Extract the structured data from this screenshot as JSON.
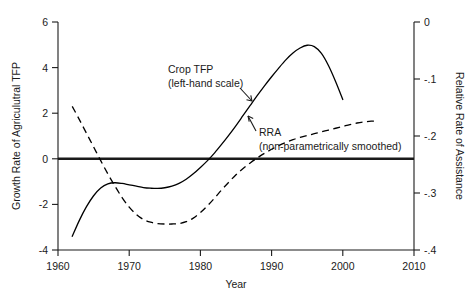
{
  "chart_data": {
    "type": "line",
    "title": "",
    "xlabel": "Year",
    "ylabel": "Growth Rate of Agriculutral TFP",
    "y2label": "Relative Rate of Assistance",
    "xlim": [
      1960,
      2010
    ],
    "ylim": [
      -4,
      6
    ],
    "y2lim": [
      -0.4,
      0.0
    ],
    "xticks": [
      "1960",
      "1970",
      "1980",
      "1990",
      "2000",
      "2010"
    ],
    "xtick_values": [
      1960,
      1970,
      1980,
      1990,
      2000,
      2010
    ],
    "yticks": [
      "6",
      "4",
      "2",
      "0",
      "-2",
      "-4"
    ],
    "ytick_values": [
      6,
      4,
      2,
      0,
      -2,
      -4
    ],
    "y2ticks": [
      "0",
      "-.1",
      "-.2",
      "-.3",
      "-.4"
    ],
    "y2tick_values": [
      0,
      -0.1,
      -0.2,
      -0.3,
      -0.4
    ],
    "grid": false,
    "zero_line": 0,
    "legend_position": "inline-annotations",
    "series": [
      {
        "name": "Crop TFP",
        "axis": "left",
        "style": "solid",
        "color": "#000000",
        "points": [
          [
            1962.0,
            -3.4
          ],
          [
            1963.0,
            -2.7
          ],
          [
            1964.0,
            -2.1
          ],
          [
            1965.0,
            -1.62
          ],
          [
            1966.0,
            -1.28
          ],
          [
            1967.0,
            -1.1
          ],
          [
            1968.0,
            -1.05
          ],
          [
            1969.0,
            -1.08
          ],
          [
            1970.0,
            -1.14
          ],
          [
            1971.0,
            -1.2
          ],
          [
            1972.0,
            -1.26
          ],
          [
            1973.0,
            -1.29
          ],
          [
            1974.0,
            -1.3
          ],
          [
            1975.0,
            -1.27
          ],
          [
            1976.0,
            -1.2
          ],
          [
            1977.0,
            -1.08
          ],
          [
            1978.0,
            -0.9
          ],
          [
            1979.0,
            -0.66
          ],
          [
            1980.0,
            -0.38
          ],
          [
            1981.0,
            -0.08
          ],
          [
            1982.0,
            0.26
          ],
          [
            1983.0,
            0.64
          ],
          [
            1984.0,
            1.04
          ],
          [
            1985.0,
            1.46
          ],
          [
            1986.0,
            1.9
          ],
          [
            1987.0,
            2.34
          ],
          [
            1988.0,
            2.78
          ],
          [
            1989.0,
            3.2
          ],
          [
            1990.0,
            3.6
          ],
          [
            1991.0,
            3.98
          ],
          [
            1992.0,
            4.34
          ],
          [
            1993.0,
            4.64
          ],
          [
            1994.0,
            4.86
          ],
          [
            1995.0,
            4.98
          ],
          [
            1996.0,
            4.92
          ],
          [
            1997.0,
            4.62
          ],
          [
            1998.0,
            4.08
          ],
          [
            1999.0,
            3.38
          ],
          [
            2000.0,
            2.6
          ]
        ]
      },
      {
        "name": "RRA (non-parametrically smoothed)",
        "axis": "right",
        "style": "dashed",
        "color": "#000000",
        "points_left_scale": [
          [
            1962.0,
            2.3
          ],
          [
            1963.0,
            1.72
          ],
          [
            1964.0,
            1.12
          ],
          [
            1965.0,
            0.52
          ],
          [
            1966.0,
            -0.08
          ],
          [
            1967.0,
            -0.66
          ],
          [
            1968.0,
            -1.2
          ],
          [
            1969.0,
            -1.7
          ],
          [
            1970.0,
            -2.12
          ],
          [
            1971.0,
            -2.44
          ],
          [
            1972.0,
            -2.66
          ],
          [
            1973.0,
            -2.78
          ],
          [
            1974.0,
            -2.84
          ],
          [
            1975.0,
            -2.86
          ],
          [
            1976.0,
            -2.86
          ],
          [
            1977.0,
            -2.84
          ],
          [
            1978.0,
            -2.76
          ],
          [
            1979.0,
            -2.6
          ],
          [
            1980.0,
            -2.36
          ],
          [
            1981.0,
            -2.06
          ],
          [
            1982.0,
            -1.72
          ],
          [
            1983.0,
            -1.36
          ],
          [
            1984.0,
            -1.02
          ],
          [
            1985.0,
            -0.7
          ],
          [
            1986.0,
            -0.42
          ],
          [
            1987.0,
            -0.18
          ],
          [
            1988.0,
            0.04
          ],
          [
            1989.0,
            0.24
          ],
          [
            1990.0,
            0.42
          ],
          [
            1991.0,
            0.58
          ],
          [
            1992.0,
            0.72
          ],
          [
            1993.0,
            0.84
          ],
          [
            1994.0,
            0.94
          ],
          [
            1995.0,
            1.02
          ],
          [
            1996.0,
            1.1
          ],
          [
            1997.0,
            1.18
          ],
          [
            1998.0,
            1.26
          ],
          [
            1999.0,
            1.34
          ],
          [
            2000.0,
            1.42
          ],
          [
            2001.0,
            1.5
          ],
          [
            2002.0,
            1.57
          ],
          [
            2003.0,
            1.62
          ],
          [
            2004.0,
            1.65
          ],
          [
            2005.0,
            1.66
          ]
        ],
        "points_right_scale": [
          [
            1962.0,
            -0.212
          ],
          [
            1965.0,
            -0.261
          ],
          [
            1968.0,
            -0.308
          ],
          [
            1971.0,
            -0.338
          ],
          [
            1974.0,
            -0.354
          ],
          [
            1977.0,
            -0.354
          ],
          [
            1980.0,
            -0.334
          ],
          [
            1983.0,
            -0.294
          ],
          [
            1986.0,
            -0.257
          ],
          [
            1989.0,
            -0.23
          ],
          [
            1992.0,
            -0.211
          ],
          [
            1995.0,
            -0.199
          ],
          [
            1998.0,
            -0.19
          ],
          [
            2001.0,
            -0.18
          ],
          [
            2005.0,
            -0.174
          ]
        ]
      }
    ],
    "annotations": [
      {
        "id": "crop-tfp",
        "line1": "Crop TFP",
        "line2": "(left-hand scale)",
        "arrow": "down-right"
      },
      {
        "id": "rra",
        "line1": "RRA",
        "line2": "(non-parametrically smoothed)",
        "arrow": "up-left"
      }
    ]
  }
}
